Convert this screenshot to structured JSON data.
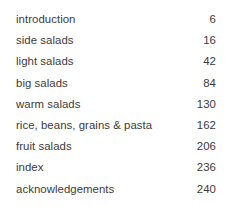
{
  "document": {
    "type": "table-of-contents",
    "background_color": "#ffffff",
    "text_color": "#3b3b3b"
  },
  "contents": {
    "entries": [
      {
        "title": "introduction",
        "page": "6"
      },
      {
        "title": "side salads",
        "page": "16"
      },
      {
        "title": "light salads",
        "page": "42"
      },
      {
        "title": "big salads",
        "page": "84"
      },
      {
        "title": "warm salads",
        "page": "130"
      },
      {
        "title": "rice, beans, grains & pasta",
        "page": "162"
      },
      {
        "title": "fruit salads",
        "page": "206"
      },
      {
        "title": "index",
        "page": "236"
      },
      {
        "title": "acknowledgements",
        "page": "240"
      }
    ]
  }
}
